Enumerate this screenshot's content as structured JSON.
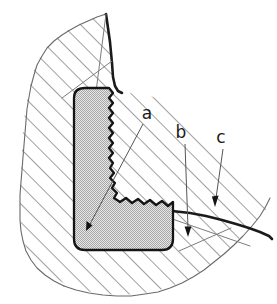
{
  "figure": {
    "kind": "technical-cross-section",
    "width": 277,
    "height": 304,
    "background_color": "#ffffff"
  },
  "colors": {
    "outline": "#1b1b1b",
    "hatch_line": "#4a4a4a",
    "break_line": "#6a6a6a",
    "bead_fill": "#c9c9c9",
    "bead_outline": "#141414",
    "leader_line": "#555555",
    "label_text": "#1b1b1b",
    "page_background": "#ffffff"
  },
  "regions": [
    {
      "name": "hatched-body",
      "label": "sectioned parent material",
      "fill_style": "diagonal-hatch",
      "hatch_angle_deg": 45,
      "hatch_spacing_px": 13
    },
    {
      "name": "bead-region",
      "label": "bead",
      "fill_style": "stipple-gray",
      "edge_style": "serrated-inner-face"
    }
  ],
  "callouts": [
    {
      "id": "a",
      "label": "a",
      "label_x": 147,
      "label_y": 119,
      "leader_from_x": 143,
      "leader_from_y": 124,
      "leader_to_x": 86,
      "leader_to_y": 231,
      "arrow_angle_deg": 242,
      "target": "bead-region"
    },
    {
      "id": "b",
      "label": "b",
      "label_x": 181,
      "label_y": 138,
      "leader_from_x": 185,
      "leader_from_y": 144,
      "leader_to_x": 188,
      "leader_to_y": 237,
      "arrow_angle_deg": 92,
      "target": "lower-flange-upper-surface"
    },
    {
      "id": "c",
      "label": "c",
      "label_x": 221,
      "label_y": 143,
      "leader_from_x": 223,
      "leader_from_y": 149,
      "leader_to_x": 215,
      "leader_to_y": 207,
      "arrow_angle_deg": 99,
      "target": "outer-edge-surface"
    }
  ]
}
